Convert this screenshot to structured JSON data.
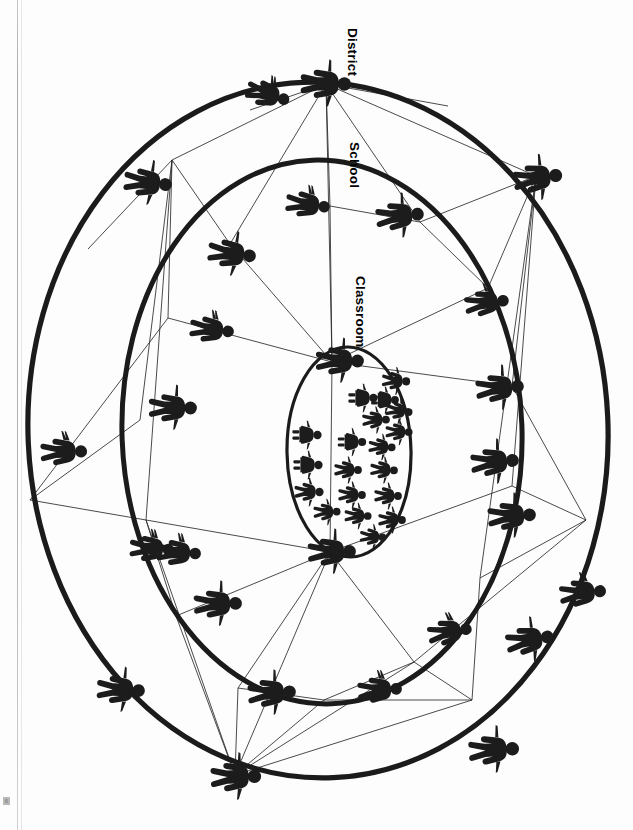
{
  "document": {
    "type": "scanned-figure",
    "orientation": "rotated-90-clockwise",
    "background_color": "#ffffff",
    "ink_color": "#1b1b1b",
    "page_marker": "6"
  },
  "figure": {
    "title_absent": true,
    "labels": [
      {
        "id": "district",
        "text": "District",
        "x": 341,
        "y": 58,
        "rotation": 90
      },
      {
        "id": "school",
        "text": "School",
        "x": 345,
        "y": 172,
        "rotation": 90
      },
      {
        "id": "classroom",
        "text": "Classroom",
        "x": 350,
        "y": 320,
        "rotation": 90
      }
    ],
    "rings": [
      {
        "id": "district-ring",
        "label": "District",
        "cx": 318,
        "cy": 430,
        "rx": 290,
        "ry": 348,
        "rotation": -2.5,
        "stroke_width": 5.2
      },
      {
        "id": "school-ring",
        "label": "School",
        "cx": 322,
        "cy": 432,
        "rx": 200,
        "ry": 272,
        "rotation": -2.0,
        "stroke_width": 5.0
      },
      {
        "id": "classroom-ring",
        "label": "Classroom",
        "cx": 349,
        "cy": 452,
        "rx": 62,
        "ry": 105,
        "rotation": -1.0,
        "stroke_width": 3.2
      }
    ],
    "actors": {
      "district_level": {
        "name": "district-actor",
        "count": 12,
        "description": "adult figures positioned on the outer District ellipse"
      },
      "school_level": {
        "name": "school-actor",
        "count": 11,
        "description": "adult figures positioned on the middle School ellipse"
      },
      "classroom_level": {
        "name": "classroom-actor",
        "count": 2,
        "description": "adult figures positioned on the inner Classroom ellipse"
      },
      "students": {
        "name": "student-figure",
        "count": 19,
        "description": "small child figures clustered inside the Classroom ellipse"
      }
    },
    "ring_nodes": {
      "district": [
        [
          326,
          84
        ],
        [
          448,
          106
        ],
        [
          536,
          176
        ],
        [
          587,
          268
        ],
        [
          600,
          392
        ],
        [
          586,
          520
        ],
        [
          546,
          620
        ],
        [
          472,
          700
        ],
        [
          362,
          760
        ],
        [
          235,
          775
        ],
        [
          130,
          727
        ],
        [
          60,
          625
        ],
        [
          30,
          500
        ],
        [
          38,
          372
        ],
        [
          88,
          249
        ],
        [
          172,
          160
        ],
        [
          250,
          110
        ]
      ],
      "school": [
        [
          330,
          206
        ],
        [
          420,
          222
        ],
        [
          488,
          288
        ],
        [
          512,
          386
        ],
        [
          512,
          486
        ],
        [
          480,
          578
        ],
        [
          414,
          662
        ],
        [
          324,
          700
        ],
        [
          238,
          688
        ],
        [
          176,
          616
        ],
        [
          146,
          520
        ],
        [
          140,
          420
        ],
        [
          168,
          318
        ],
        [
          230,
          244
        ]
      ],
      "classroom": [
        [
          332,
          362
        ],
        [
          330,
          552
        ]
      ]
    },
    "edges_description": "thin straight lines radiating from node figures, linking District nodes to School nodes and School nodes to Classroom nodes"
  }
}
